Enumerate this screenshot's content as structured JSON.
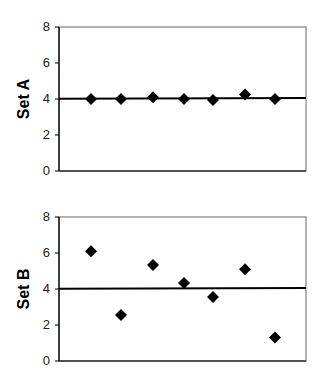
{
  "chart_data": [
    {
      "type": "scatter",
      "title": "",
      "xlabel": "",
      "ylabel": "Set A",
      "ylim": [
        0,
        8
      ],
      "yticks": [
        "0",
        "2",
        "4",
        "6",
        "8"
      ],
      "grid": false,
      "legend": null,
      "x": [
        1,
        2,
        3,
        4,
        5,
        6,
        7
      ],
      "series": [
        {
          "name": "Set A",
          "marker": "diamond",
          "values": [
            4.0,
            4.0,
            4.1,
            4.0,
            3.95,
            4.25,
            4.0
          ]
        }
      ],
      "reference_line": {
        "label": "mean",
        "y": 4.04
      }
    },
    {
      "type": "scatter",
      "title": "",
      "xlabel": "",
      "ylabel": "Set B",
      "ylim": [
        0,
        8
      ],
      "yticks": [
        "0",
        "2",
        "4",
        "6",
        "8"
      ],
      "grid": false,
      "legend": null,
      "x": [
        1,
        2,
        3,
        4,
        5,
        6,
        7
      ],
      "series": [
        {
          "name": "Set B",
          "marker": "diamond",
          "values": [
            6.1,
            2.55,
            5.33,
            4.33,
            3.55,
            5.1,
            1.3
          ]
        }
      ],
      "reference_line": {
        "label": "mean",
        "y": 4.04
      }
    }
  ],
  "charts": {
    "a": {
      "ylabel": "Set A"
    },
    "b": {
      "ylabel": "Set B"
    }
  },
  "ticks": {
    "t0": "0",
    "t2": "2",
    "t4": "4",
    "t6": "6",
    "t8": "8"
  },
  "colors": {
    "marker": "#000000",
    "axis": "#000000",
    "frame": "#808080",
    "mean_line": "#000000"
  }
}
